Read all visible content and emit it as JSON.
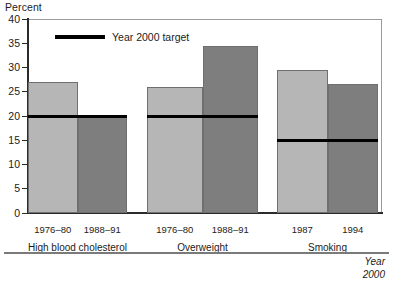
{
  "chart_data": {
    "type": "bar",
    "title": "",
    "ylabel": "Percent",
    "xlabel": "",
    "ylim": [
      0,
      40
    ],
    "yticks": [
      0,
      5,
      10,
      15,
      20,
      25,
      30,
      35,
      40
    ],
    "grid": false,
    "legend_position": "top-left",
    "legend": [
      "Year 2000 target"
    ],
    "groups": [
      {
        "name": "High blood cholesterol",
        "categories": [
          "1976–80",
          "1988–91"
        ],
        "values": [
          27.0,
          20.0
        ],
        "target": 20.0
      },
      {
        "name": "Overweight",
        "categories": [
          "1976–80",
          "1988–91"
        ],
        "values": [
          26.0,
          34.5
        ],
        "target": 20.0
      },
      {
        "name": "Smoking",
        "categories": [
          "1987",
          "1994"
        ],
        "values": [
          29.5,
          26.5
        ],
        "target": 15.0
      }
    ],
    "series": [
      {
        "name": "Earlier period",
        "values": [
          27.0,
          26.0,
          29.5
        ],
        "color": "#b6b6b6"
      },
      {
        "name": "Later period",
        "values": [
          20.0,
          34.5,
          26.5
        ],
        "color": "#7e7e7e"
      }
    ],
    "target_line_color": "#000000"
  },
  "axis": {
    "y_title": "Percent",
    "ticks": [
      "40",
      "35",
      "30",
      "25",
      "20",
      "15",
      "10",
      "5",
      "0"
    ]
  },
  "legend": {
    "target_label": "Year 2000 target"
  },
  "groups": [
    {
      "label": "High blood cholesterol",
      "year_left": "1976–80",
      "year_right": "1988–91"
    },
    {
      "label": "Overweight",
      "year_left": "1976–80",
      "year_right": "1988–91"
    },
    {
      "label": "Smoking",
      "year_left": "1987",
      "year_right": "1994"
    }
  ],
  "footer": {
    "line1": "Year",
    "line2": "2000"
  }
}
